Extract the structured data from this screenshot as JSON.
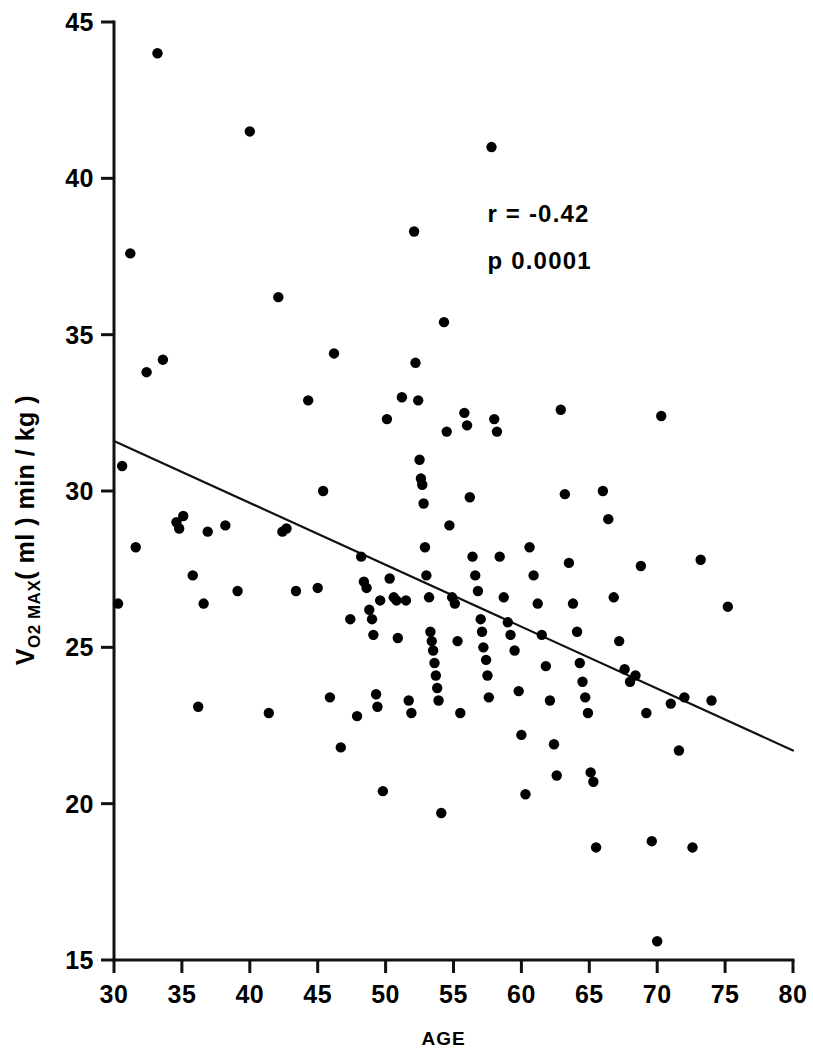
{
  "chart_data": {
    "type": "scatter",
    "title": "",
    "xlabel": "AGE",
    "ylabel": "V",
    "ylabel_sub": "O2 MAX",
    "ylabel_rest": "( ml ) min / kg )",
    "xlim": [
      30,
      80
    ],
    "ylim": [
      15,
      45
    ],
    "xticks": [
      30,
      35,
      40,
      45,
      50,
      55,
      60,
      65,
      70,
      75,
      80
    ],
    "yticks": [
      15,
      20,
      25,
      30,
      35,
      40,
      45
    ],
    "grid": false,
    "legend": false,
    "annotations": [
      {
        "text": "r = -0.42",
        "x": 57.5,
        "y": 38.6
      },
      {
        "text": "p  0.0001",
        "x": 57.5,
        "y": 37.1
      }
    ],
    "regression": {
      "type": "line",
      "x0": 30,
      "y0": 31.6,
      "x1": 80,
      "y1": 21.7,
      "slope": -0.198,
      "intercept": 37.54
    },
    "points": [
      [
        30.3,
        26.4
      ],
      [
        30.6,
        30.8
      ],
      [
        31.2,
        37.6
      ],
      [
        31.6,
        28.2
      ],
      [
        32.4,
        33.8
      ],
      [
        33.2,
        44.0
      ],
      [
        33.6,
        34.2
      ],
      [
        34.6,
        29.0
      ],
      [
        34.8,
        28.8
      ],
      [
        35.1,
        29.2
      ],
      [
        35.8,
        27.3
      ],
      [
        36.2,
        23.1
      ],
      [
        36.6,
        26.4
      ],
      [
        36.9,
        28.7
      ],
      [
        38.2,
        28.9
      ],
      [
        39.1,
        26.8
      ],
      [
        40.0,
        41.5
      ],
      [
        41.4,
        22.9
      ],
      [
        42.1,
        36.2
      ],
      [
        42.4,
        28.7
      ],
      [
        42.7,
        28.8
      ],
      [
        43.4,
        26.8
      ],
      [
        44.3,
        32.9
      ],
      [
        45.0,
        26.9
      ],
      [
        45.4,
        30.0
      ],
      [
        45.9,
        23.4
      ],
      [
        46.2,
        34.4
      ],
      [
        46.7,
        21.8
      ],
      [
        47.4,
        25.9
      ],
      [
        47.9,
        22.8
      ],
      [
        48.2,
        27.9
      ],
      [
        48.4,
        27.1
      ],
      [
        48.6,
        26.9
      ],
      [
        48.8,
        26.2
      ],
      [
        49.0,
        25.9
      ],
      [
        49.1,
        25.4
      ],
      [
        49.3,
        23.5
      ],
      [
        49.4,
        23.1
      ],
      [
        49.6,
        26.5
      ],
      [
        49.8,
        20.4
      ],
      [
        50.1,
        32.3
      ],
      [
        50.3,
        27.2
      ],
      [
        50.6,
        26.6
      ],
      [
        50.8,
        26.5
      ],
      [
        50.9,
        25.3
      ],
      [
        51.2,
        33.0
      ],
      [
        51.5,
        26.5
      ],
      [
        51.7,
        23.3
      ],
      [
        51.9,
        22.9
      ],
      [
        52.1,
        38.3
      ],
      [
        52.2,
        34.1
      ],
      [
        52.4,
        32.9
      ],
      [
        52.5,
        31.0
      ],
      [
        52.6,
        30.4
      ],
      [
        52.7,
        30.2
      ],
      [
        52.8,
        29.6
      ],
      [
        52.9,
        28.2
      ],
      [
        53.0,
        27.3
      ],
      [
        53.2,
        26.6
      ],
      [
        53.3,
        25.5
      ],
      [
        53.4,
        25.2
      ],
      [
        53.5,
        24.9
      ],
      [
        53.6,
        24.5
      ],
      [
        53.7,
        24.1
      ],
      [
        53.8,
        23.7
      ],
      [
        53.9,
        23.3
      ],
      [
        54.1,
        19.7
      ],
      [
        54.3,
        35.4
      ],
      [
        54.5,
        31.9
      ],
      [
        54.7,
        28.9
      ],
      [
        54.9,
        26.6
      ],
      [
        55.1,
        26.4
      ],
      [
        55.3,
        25.2
      ],
      [
        55.5,
        22.9
      ],
      [
        55.8,
        32.5
      ],
      [
        56.0,
        32.1
      ],
      [
        56.2,
        29.8
      ],
      [
        56.4,
        27.9
      ],
      [
        56.6,
        27.3
      ],
      [
        56.8,
        26.8
      ],
      [
        57.0,
        25.9
      ],
      [
        57.1,
        25.5
      ],
      [
        57.2,
        25.0
      ],
      [
        57.4,
        24.6
      ],
      [
        57.5,
        24.1
      ],
      [
        57.6,
        23.4
      ],
      [
        57.8,
        41.0
      ],
      [
        58.0,
        32.3
      ],
      [
        58.2,
        31.9
      ],
      [
        58.4,
        27.9
      ],
      [
        58.7,
        26.6
      ],
      [
        59.0,
        25.8
      ],
      [
        59.2,
        25.4
      ],
      [
        59.5,
        24.9
      ],
      [
        59.8,
        23.6
      ],
      [
        60.0,
        22.2
      ],
      [
        60.3,
        20.3
      ],
      [
        60.6,
        28.2
      ],
      [
        60.9,
        27.3
      ],
      [
        61.2,
        26.4
      ],
      [
        61.5,
        25.4
      ],
      [
        61.8,
        24.4
      ],
      [
        62.1,
        23.3
      ],
      [
        62.4,
        21.9
      ],
      [
        62.6,
        20.9
      ],
      [
        62.9,
        32.6
      ],
      [
        63.2,
        29.9
      ],
      [
        63.5,
        27.7
      ],
      [
        63.8,
        26.4
      ],
      [
        64.1,
        25.5
      ],
      [
        64.3,
        24.5
      ],
      [
        64.5,
        23.9
      ],
      [
        64.7,
        23.4
      ],
      [
        64.9,
        22.9
      ],
      [
        65.1,
        21.0
      ],
      [
        65.3,
        20.7
      ],
      [
        65.5,
        18.6
      ],
      [
        66.0,
        30.0
      ],
      [
        66.4,
        29.1
      ],
      [
        66.8,
        26.6
      ],
      [
        67.2,
        25.2
      ],
      [
        67.6,
        24.3
      ],
      [
        68.0,
        23.9
      ],
      [
        68.4,
        24.1
      ],
      [
        68.8,
        27.6
      ],
      [
        69.2,
        22.9
      ],
      [
        69.6,
        18.8
      ],
      [
        70.0,
        15.6
      ],
      [
        70.3,
        32.4
      ],
      [
        71.0,
        23.2
      ],
      [
        71.6,
        21.7
      ],
      [
        72.0,
        23.4
      ],
      [
        72.6,
        18.6
      ],
      [
        73.2,
        27.8
      ],
      [
        74.0,
        23.3
      ],
      [
        75.2,
        26.3
      ]
    ]
  }
}
